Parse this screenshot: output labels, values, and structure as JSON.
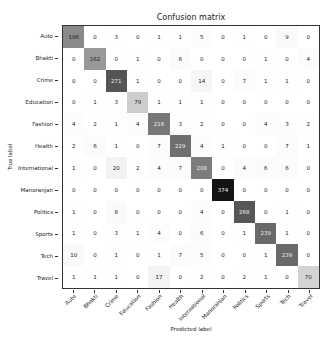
{
  "chart_data": {
    "type": "heatmap",
    "title": "Confusion matrix",
    "xlabel": "Predicted label",
    "ylabel": "True label",
    "labels": [
      "Auto",
      "Bhakti",
      "Crime",
      "Education",
      "Fashion",
      "Health",
      "International",
      "Manoranjan",
      "Politics",
      "Sports",
      "Tech",
      "Travel"
    ],
    "matrix": [
      [
        186,
        0,
        3,
        0,
        1,
        1,
        5,
        0,
        1,
        0,
        9,
        0
      ],
      [
        0,
        162,
        0,
        1,
        0,
        6,
        0,
        0,
        0,
        1,
        0,
        4
      ],
      [
        0,
        0,
        271,
        1,
        0,
        0,
        14,
        0,
        7,
        1,
        1,
        0
      ],
      [
        0,
        1,
        3,
        79,
        1,
        1,
        1,
        0,
        0,
        0,
        0,
        0
      ],
      [
        4,
        2,
        1,
        4,
        216,
        3,
        2,
        0,
        0,
        4,
        3,
        2
      ],
      [
        2,
        6,
        1,
        0,
        7,
        229,
        4,
        1,
        0,
        0,
        7,
        1
      ],
      [
        1,
        0,
        20,
        2,
        4,
        7,
        208,
        0,
        4,
        6,
        6,
        0
      ],
      [
        0,
        0,
        0,
        0,
        0,
        0,
        0,
        374,
        0,
        0,
        0,
        0
      ],
      [
        1,
        0,
        8,
        0,
        0,
        0,
        4,
        0,
        268,
        0,
        1,
        0
      ],
      [
        1,
        0,
        3,
        1,
        4,
        0,
        6,
        0,
        1,
        239,
        1,
        0
      ],
      [
        10,
        0,
        1,
        0,
        1,
        7,
        5,
        0,
        0,
        1,
        239,
        0
      ],
      [
        1,
        1,
        1,
        0,
        17,
        0,
        2,
        0,
        2,
        1,
        0,
        70
      ]
    ],
    "colormap": "Greys",
    "vmin": 0,
    "vmax": 374,
    "grid": false
  }
}
